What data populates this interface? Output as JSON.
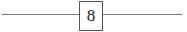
{
  "diagram": {
    "node": {
      "label": "8"
    },
    "edges": [
      {
        "side": "left"
      },
      {
        "side": "right"
      }
    ]
  }
}
